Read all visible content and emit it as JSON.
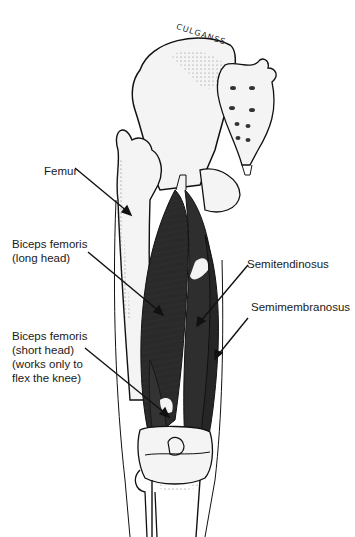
{
  "figure": {
    "signature": "CULGANSS",
    "colors": {
      "muscle": "#2a2a2a",
      "bone_outline": "#111111",
      "bone_fill": "#f4f4f4",
      "background": "#ffffff"
    }
  },
  "labels": [
    {
      "id": "femur",
      "text": "Femur"
    },
    {
      "id": "biceps-long",
      "text": "Biceps femoris\n(long head)"
    },
    {
      "id": "semitendinosus",
      "text": "Semitendinosus"
    },
    {
      "id": "semimembranosus",
      "text": "Semimembranosus"
    },
    {
      "id": "biceps-short",
      "text": "Biceps femoris\n(short head)\n(works only to\nflex the knee)"
    }
  ]
}
